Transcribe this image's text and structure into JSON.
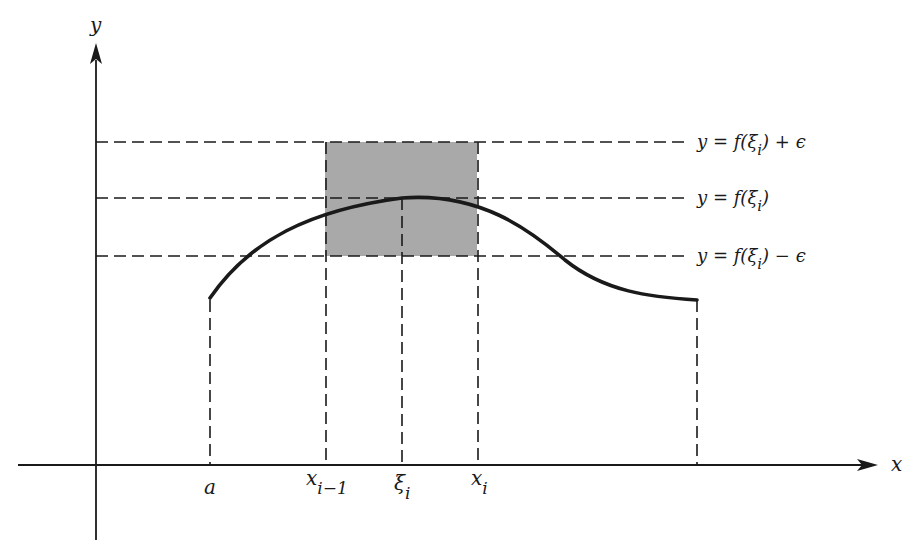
{
  "figure": {
    "axes": {
      "x_label": "x",
      "y_label": "y"
    },
    "x_ticks": [
      {
        "id": "a",
        "base": "a",
        "sub": ""
      },
      {
        "id": "x_i_minus_1",
        "base": "x",
        "sub": "i−1"
      },
      {
        "id": "xi_i",
        "base": "ξ",
        "sub": "i"
      },
      {
        "id": "x_i",
        "base": "x",
        "sub": "i"
      }
    ],
    "horizontal_lines": [
      {
        "id": "upper",
        "prefix": "y = f(ξ",
        "sub": "i",
        "suffix": ") + ϵ"
      },
      {
        "id": "middle",
        "prefix": "y = f(ξ",
        "sub": "i",
        "suffix": ")"
      },
      {
        "id": "lower",
        "prefix": "y = f(ξ",
        "sub": "i",
        "suffix": ") − ϵ"
      }
    ],
    "colors": {
      "ink": "#1a1a1a",
      "shade": "#a9a9a9",
      "background": "#ffffff"
    }
  }
}
